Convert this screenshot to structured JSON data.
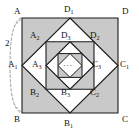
{
  "figure": {
    "colors": {
      "outer_fill": "#c9c9c9",
      "square2_fill": "#c9c9c9",
      "square4_fill": "#c9c9c9",
      "diamond_fill": "#ffffff",
      "stroke": "#1a1a1a",
      "background": "#ffffff",
      "brace": "#9a9a9a"
    },
    "center_ellipsis": "···",
    "dimension": {
      "label": "2",
      "from": "A",
      "to": "B"
    },
    "vertices": {
      "outer_square": [
        {
          "id": "A",
          "base": "A",
          "sub": "",
          "x": 16,
          "y": 12,
          "corner": "top-left"
        },
        {
          "id": "D",
          "base": "D",
          "sub": "",
          "x": 123,
          "y": 12,
          "corner": "top-right"
        },
        {
          "id": "B",
          "base": "B",
          "sub": "",
          "x": 16,
          "y": 119,
          "corner": "bottom-left"
        },
        {
          "id": "C",
          "base": "C",
          "sub": "",
          "x": 123,
          "y": 119,
          "corner": "bottom-right"
        }
      ],
      "diamond_1": [
        {
          "id": "D1",
          "base": "D",
          "sub": "1",
          "x": 66,
          "y": 8,
          "corner": "top"
        },
        {
          "id": "C1",
          "base": "C",
          "sub": "1",
          "x": 124,
          "y": 62,
          "corner": "right"
        },
        {
          "id": "B1",
          "base": "B",
          "sub": "1",
          "x": 66,
          "y": 121,
          "corner": "bottom"
        },
        {
          "id": "A1",
          "base": "A",
          "sub": "1",
          "x": 8,
          "y": 62,
          "corner": "left"
        }
      ],
      "square_2": [
        {
          "id": "A2",
          "base": "A",
          "sub": "2",
          "x": 31,
          "y": 30,
          "corner": "top-left"
        },
        {
          "id": "D2",
          "base": "D",
          "sub": "2",
          "x": 93,
          "y": 30,
          "corner": "top-right"
        },
        {
          "id": "B2",
          "base": "B",
          "sub": "2",
          "x": 31,
          "y": 92,
          "corner": "bottom-left"
        },
        {
          "id": "C2",
          "base": "C",
          "sub": "2",
          "x": 93,
          "y": 92,
          "corner": "bottom-right"
        }
      ],
      "diamond_3": [
        {
          "id": "D3",
          "base": "D",
          "sub": "3",
          "x": 63,
          "y": 30,
          "corner": "top"
        },
        {
          "id": "C3",
          "base": "C",
          "sub": "3",
          "x": 95,
          "y": 62,
          "corner": "right"
        },
        {
          "id": "B3",
          "base": "B",
          "sub": "3",
          "x": 63,
          "y": 92,
          "corner": "bottom"
        },
        {
          "id": "A3",
          "base": "A",
          "sub": "3",
          "x": 34,
          "y": 62,
          "corner": "left"
        }
      ]
    }
  }
}
